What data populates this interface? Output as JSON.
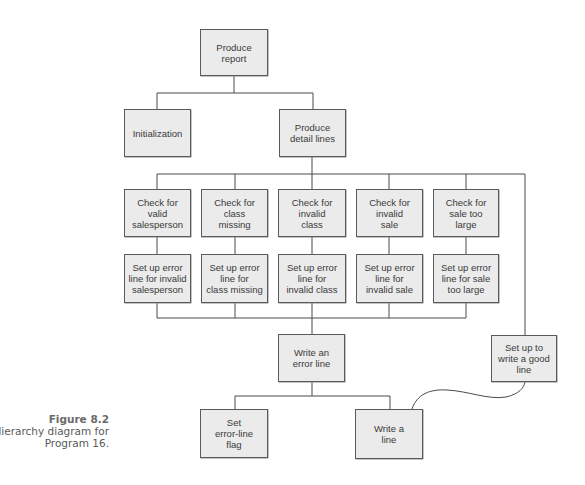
{
  "figure": {
    "label": "Figure 8.2",
    "caption_line1": "Hierarchy diagram for",
    "caption_line2": "Program 16."
  },
  "colors": {
    "box_fill": "#ebebeb",
    "box_border": "#5a5a5a",
    "line": "#4a4a4a",
    "text": "#3a3a3a",
    "caption": "#5a5a5a"
  },
  "nodes": {
    "produce_report": "Produce\nreport",
    "initialization": "Initialization",
    "produce_detail_lines": "Produce\ndetail lines",
    "check_valid_salesperson": "Check for\nvalid\nsalesperson",
    "check_class_missing": "Check for\nclass\nmissing",
    "check_invalid_class": "Check for\ninvalid\nclass",
    "check_invalid_sale": "Check for\ninvalid\nsale",
    "check_sale_too_large": "Check for\nsale too\nlarge",
    "error_invalid_salesperson": "Set up error\nline for invalid\nsalesperson",
    "error_class_missing": "Set up error\nline for\nclass missing",
    "error_invalid_class": "Set up error\nline for\ninvalid class",
    "error_invalid_sale": "Set up error\nline for\ninvalid sale",
    "error_sale_too_large": "Set up error\nline for sale\ntoo large",
    "write_error_line": "Write an\nerror line",
    "set_up_good_line": "Set up to\nwrite a good\nline",
    "set_error_line_flag": "Set\nerror-line\nflag",
    "write_a_line": "Write a\nline"
  },
  "edges": [
    [
      "produce_report",
      "initialization"
    ],
    [
      "produce_report",
      "produce_detail_lines"
    ],
    [
      "produce_detail_lines",
      "check_valid_salesperson"
    ],
    [
      "produce_detail_lines",
      "check_class_missing"
    ],
    [
      "produce_detail_lines",
      "check_invalid_class"
    ],
    [
      "produce_detail_lines",
      "check_invalid_sale"
    ],
    [
      "produce_detail_lines",
      "check_sale_too_large"
    ],
    [
      "produce_detail_lines",
      "set_up_good_line"
    ],
    [
      "check_valid_salesperson",
      "error_invalid_salesperson"
    ],
    [
      "check_class_missing",
      "error_class_missing"
    ],
    [
      "check_invalid_class",
      "error_invalid_class"
    ],
    [
      "check_invalid_sale",
      "error_invalid_sale"
    ],
    [
      "check_sale_too_large",
      "error_sale_too_large"
    ],
    [
      "error_invalid_salesperson",
      "write_error_line"
    ],
    [
      "error_class_missing",
      "write_error_line"
    ],
    [
      "error_invalid_class",
      "write_error_line"
    ],
    [
      "error_invalid_sale",
      "write_error_line"
    ],
    [
      "error_sale_too_large",
      "write_error_line"
    ],
    [
      "write_error_line",
      "set_error_line_flag"
    ],
    [
      "write_error_line",
      "write_a_line"
    ],
    [
      "set_up_good_line",
      "write_a_line"
    ]
  ]
}
